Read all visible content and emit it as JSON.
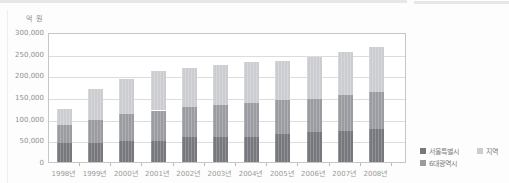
{
  "chart_data": {
    "type": "bar",
    "stacked": true,
    "unit_label": "억 원",
    "categories": [
      "1998년",
      "1999년",
      "2000년",
      "2001년",
      "2002년",
      "2003년",
      "2004년",
      "2005년",
      "2006년",
      "2007년",
      "2008년"
    ],
    "series": [
      {
        "name": "서울특별시",
        "color": "#77787d",
        "values": [
          43000,
          44000,
          48000,
          49000,
          57000,
          57000,
          58000,
          64000,
          69000,
          72000,
          75000
        ]
      },
      {
        "name": "6대광역시",
        "color": "#9b9ca1",
        "values": [
          42000,
          52000,
          63000,
          70000,
          69000,
          75000,
          78000,
          79000,
          77000,
          83000,
          86000
        ]
      },
      {
        "name": "지역",
        "color": "#cccdd1",
        "values": [
          37000,
          72000,
          81000,
          90000,
          91000,
          92000,
          94000,
          91000,
          96000,
          100000,
          104000
        ]
      }
    ],
    "ylim": [
      0,
      300000
    ],
    "ytick_step": 50000,
    "ytick_labels": [
      "0",
      "50,000",
      "100,000",
      "150,000",
      "200,000",
      "250,000",
      "300,000"
    ],
    "grid": true,
    "legend_position": "bottom-right",
    "legend_display_order": [
      "서울특별시",
      "지역",
      "6대광역시"
    ]
  }
}
